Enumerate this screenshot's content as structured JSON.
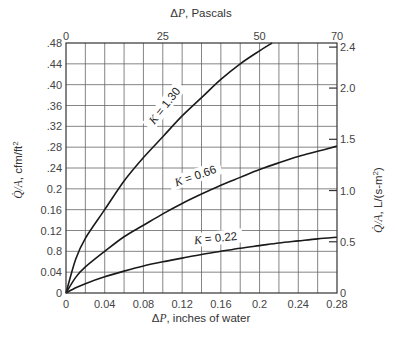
{
  "chart_data": {
    "type": "line",
    "title": "",
    "xlabel": "ΔP, inches of water",
    "ylabel": "Q̇/A, cfm/ft²",
    "x2label": "ΔP, Pascals",
    "y2label": "Q̇/A, L/(s·m²)",
    "xlim": [
      0,
      0.28
    ],
    "ylim": [
      0,
      0.48
    ],
    "x2lim": [
      0,
      70
    ],
    "y2lim": [
      0,
      2.44
    ],
    "grid": true,
    "x_ticks": [
      "0",
      "0.04",
      "0.08",
      "0.12",
      "0.16",
      "0.2",
      "0.24",
      "0.28"
    ],
    "y_ticks": [
      "0",
      "0.04",
      "0.8",
      "0.12",
      "0.16",
      "0.2",
      ".24",
      ".28",
      ".32",
      ".36",
      ".40",
      ".44",
      ".48"
    ],
    "x2_ticks": [
      {
        "label": "0",
        "value": 0
      },
      {
        "label": "25",
        "value": 25
      },
      {
        "label": "50",
        "value": 50
      },
      {
        "label": "70",
        "value": 70
      }
    ],
    "y2_ticks": [
      {
        "label": "0",
        "value": 0
      },
      {
        "label": "0.5",
        "value": 0.5
      },
      {
        "label": "1.0",
        "value": 1.0
      },
      {
        "label": "1.5",
        "value": 1.5
      },
      {
        "label": "2.0",
        "value": 2.0
      },
      {
        "label": "2.4",
        "value": 2.4
      }
    ],
    "x_grid_step": 0.02,
    "y_grid_step": 0.04,
    "series": [
      {
        "name": "K = 1.30",
        "x": [
          0,
          0.01,
          0.02,
          0.04,
          0.06,
          0.08,
          0.1,
          0.12,
          0.14,
          0.16,
          0.18,
          0.2,
          0.213
        ],
        "y": [
          0,
          0.065,
          0.105,
          0.16,
          0.215,
          0.26,
          0.3,
          0.34,
          0.375,
          0.41,
          0.44,
          0.465,
          0.48
        ]
      },
      {
        "name": "K = 0.66",
        "x": [
          0,
          0.01,
          0.02,
          0.04,
          0.06,
          0.08,
          0.1,
          0.12,
          0.14,
          0.16,
          0.18,
          0.2,
          0.22,
          0.24,
          0.26,
          0.28
        ],
        "y": [
          0,
          0.03,
          0.05,
          0.08,
          0.108,
          0.13,
          0.152,
          0.172,
          0.19,
          0.207,
          0.222,
          0.237,
          0.25,
          0.262,
          0.272,
          0.282
        ]
      },
      {
        "name": "K = 0.22",
        "x": [
          0,
          0.01,
          0.02,
          0.04,
          0.06,
          0.08,
          0.1,
          0.12,
          0.14,
          0.16,
          0.18,
          0.2,
          0.22,
          0.24,
          0.26,
          0.28
        ],
        "y": [
          0,
          0.01,
          0.018,
          0.031,
          0.042,
          0.052,
          0.06,
          0.067,
          0.074,
          0.08,
          0.086,
          0.091,
          0.096,
          0.1,
          0.104,
          0.107
        ]
      }
    ],
    "annotations": [
      {
        "text": "K = 1.30",
        "x": 0.105,
        "y": 0.355,
        "rotation": -52
      },
      {
        "text": "K = 0.66",
        "x": 0.135,
        "y": 0.218,
        "rotation": -19
      },
      {
        "text": "K = 0.22",
        "x": 0.155,
        "y": 0.098,
        "rotation": -6
      }
    ]
  }
}
